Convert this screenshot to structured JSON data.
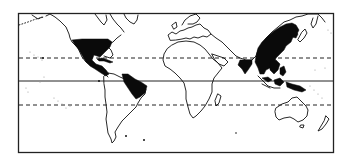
{
  "map": {
    "type": "world distribution map",
    "style": "black-and-white line map",
    "colors": {
      "land_outline": "#111111",
      "distribution_fill": "#0a0a0a",
      "background": "#ffffff",
      "frame": "#222222"
    },
    "reference_lines": [
      {
        "name": "Tropic of Cancer",
        "style": "dashed",
        "y": 58
      },
      {
        "name": "Equator",
        "style": "solid",
        "y": 81
      },
      {
        "name": "Tropic of Capricorn",
        "style": "dashed",
        "y": 105
      }
    ],
    "shaded_regions": [
      {
        "name": "Mexico and Central America"
      },
      {
        "name": "Caribbean / Greater Antilles"
      },
      {
        "name": "Northeastern Brazil"
      },
      {
        "name": "India (southwest coast)"
      },
      {
        "name": "East and Southeast Asia (China, Japan, Korea, Indochina)"
      },
      {
        "name": "Indonesia / Philippines / New Guinea"
      }
    ]
  }
}
